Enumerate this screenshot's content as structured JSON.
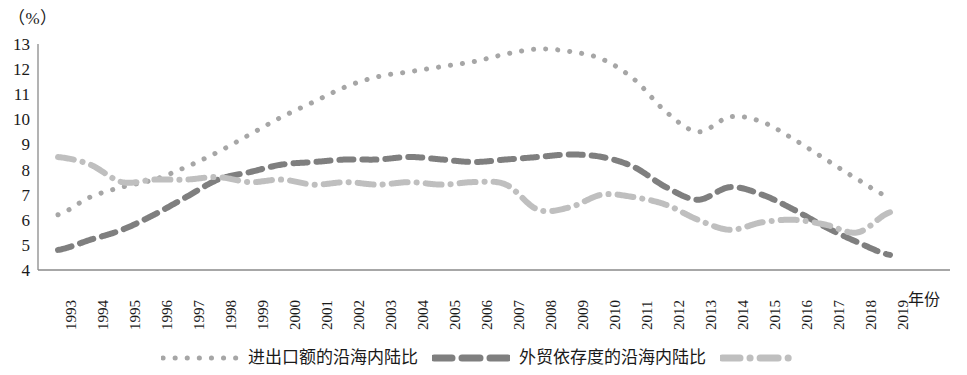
{
  "chart_data": {
    "type": "line",
    "title": "",
    "subtitle": "",
    "xlabel": "年份",
    "ylabel": "",
    "unit_label": "（%）",
    "grid": false,
    "legend_position": "bottom",
    "xlim": [
      1993,
      2019
    ],
    "ylim": [
      4,
      13
    ],
    "y_ticks": [
      13,
      12,
      11,
      10,
      9,
      8,
      7,
      6,
      5,
      4
    ],
    "categories": [
      "1993",
      "1994",
      "1995",
      "1996",
      "1997",
      "1998",
      "1999",
      "2000",
      "2001",
      "2002",
      "2003",
      "2004",
      "2005",
      "2006",
      "2007",
      "2008",
      "2009",
      "2010",
      "2011",
      "2012",
      "2013",
      "2014",
      "2015",
      "2016",
      "2017",
      "2018",
      "2019"
    ],
    "series": [
      {
        "name": "进出口额的沿海内陆比",
        "style": "dotted",
        "color": "#a6a6a6",
        "values": [
          6.2,
          6.9,
          7.3,
          7.6,
          8.1,
          8.7,
          9.4,
          10.1,
          10.7,
          11.3,
          11.7,
          11.9,
          12.1,
          12.3,
          12.6,
          12.8,
          12.7,
          12.4,
          11.6,
          10.3,
          9.5,
          10.1,
          9.9,
          9.2,
          8.4,
          7.6,
          6.9
        ]
      },
      {
        "name": "外贸依存度的沿海内陆比",
        "style": "dashed",
        "color": "#7f7f7f",
        "values": [
          4.8,
          5.2,
          5.6,
          6.2,
          6.9,
          7.6,
          7.9,
          8.2,
          8.3,
          8.4,
          8.4,
          8.5,
          8.4,
          8.3,
          8.4,
          8.5,
          8.6,
          8.5,
          8.1,
          7.3,
          6.8,
          7.3,
          7.0,
          6.4,
          5.7,
          5.1,
          4.6
        ]
      },
      {
        "name": "",
        "style": "dash-dot",
        "color": "#bfbfbf",
        "values": [
          8.5,
          8.2,
          7.5,
          7.6,
          7.6,
          7.7,
          7.5,
          7.6,
          7.4,
          7.5,
          7.4,
          7.5,
          7.4,
          7.5,
          7.4,
          6.4,
          6.5,
          7.0,
          6.9,
          6.6,
          6.0,
          5.6,
          5.9,
          6.0,
          5.8,
          5.5,
          6.3
        ]
      }
    ],
    "series_tail": {
      "dotted_end": [
        5.6,
        5.5,
        5.8,
        5.8,
        5.6,
        5.2,
        5.0
      ],
      "dashed_end": [
        4.9,
        4.6,
        4.7,
        4.8,
        4.6,
        4.4,
        4.0
      ]
    }
  },
  "legend": {
    "entries": [
      {
        "label": "进出口额的沿海内陆比",
        "marker": "dotted-marker",
        "color": "#a6a6a6"
      },
      {
        "label": "外贸依存度的沿海内陆比",
        "marker": "dashed-marker",
        "color": "#7f7f7f"
      },
      {
        "label": "",
        "marker": "dash-dot-marker",
        "color": "#bfbfbf"
      }
    ]
  },
  "axes": {
    "unit": "（%）",
    "x_title": "年份"
  }
}
